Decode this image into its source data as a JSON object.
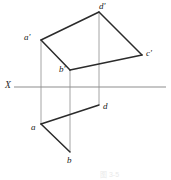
{
  "figure": {
    "type": "descriptive-geometry-orthographic-projection",
    "colors": {
      "solid_line": "#2b2b2b",
      "projection_line": "#9a9a9a",
      "axis_line": "#8d8d8d",
      "label_text": "#1a1a1a",
      "background": "#ffffff"
    },
    "axis": {
      "name": "X",
      "label": "X",
      "label_x": 5,
      "label_y": 81,
      "y": 87,
      "x_start": 14,
      "x_end": 166
    },
    "points": [
      {
        "id": "a-prime",
        "label": "a'",
        "x": 41,
        "y": 40,
        "label_x": 24,
        "label_y": 33,
        "view": "front"
      },
      {
        "id": "d-prime",
        "label": "d'",
        "x": 99,
        "y": 12,
        "label_x": 99,
        "label_y": 3,
        "view": "front"
      },
      {
        "id": "c-prime",
        "label": "c'",
        "x": 142,
        "y": 55,
        "label_x": 146,
        "label_y": 50,
        "view": "front"
      },
      {
        "id": "b-prime",
        "label": "b'",
        "x": 70,
        "y": 70,
        "label_x": 59,
        "label_y": 66,
        "view": "front"
      },
      {
        "id": "a",
        "label": "a",
        "x": 41,
        "y": 124,
        "label_x": 31,
        "label_y": 126,
        "view": "top"
      },
      {
        "id": "d",
        "label": "d",
        "x": 99,
        "y": 105,
        "label_x": 103,
        "label_y": 104,
        "view": "top"
      },
      {
        "id": "b",
        "label": "b",
        "x": 70,
        "y": 152,
        "label_x": 67,
        "label_y": 158,
        "view": "top"
      }
    ],
    "solid_edges": [
      {
        "id": "edge-aprime-dprime",
        "from": "a-prime",
        "to": "d-prime"
      },
      {
        "id": "edge-dprime-cprime",
        "from": "d-prime",
        "to": "c-prime"
      },
      {
        "id": "edge-cprime-bprime",
        "from": "c-prime",
        "to": "b-prime"
      },
      {
        "id": "edge-bprime-aprime",
        "from": "b-prime",
        "to": "a-prime"
      },
      {
        "id": "edge-a-d",
        "from": "a",
        "to": "d"
      },
      {
        "id": "edge-a-b",
        "from": "a",
        "to": "b"
      }
    ],
    "projection_lines": [
      {
        "id": "proj-a",
        "x": 41,
        "y1": 40,
        "y2": 124
      },
      {
        "id": "proj-b",
        "x": 70,
        "y1": 70,
        "y2": 152
      },
      {
        "id": "proj-d",
        "x": 99,
        "y1": 12,
        "y2": 105
      }
    ],
    "caption": {
      "text": "图 3-5",
      "x": 100,
      "y": 171
    }
  }
}
